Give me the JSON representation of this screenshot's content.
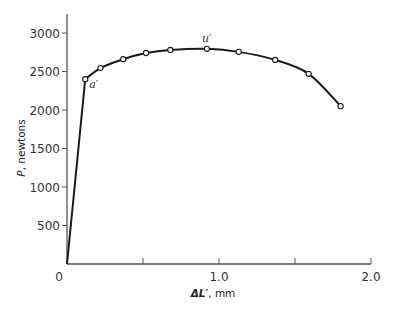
{
  "chart_data": {
    "type": "line",
    "title": "",
    "xlabel": "ΔL′, mm",
    "ylabel": "P, newtons",
    "xlim": [
      0,
      2.0
    ],
    "ylim": [
      0,
      3250
    ],
    "x_ticks": [
      0,
      0.5,
      1.0,
      1.5,
      2.0
    ],
    "x_tick_labels": [
      "0",
      "",
      "1.0",
      "",
      "2.0"
    ],
    "y_ticks": [
      500,
      1000,
      1500,
      2000,
      2500,
      3000
    ],
    "y_tick_labels": [
      "500",
      "1000",
      "1500",
      "2000",
      "2500",
      "3000"
    ],
    "grid": false,
    "legend": null,
    "series": [
      {
        "name": "load-elongation",
        "x": [
          0,
          0.12,
          0.22,
          0.37,
          0.52,
          0.68,
          0.92,
          1.13,
          1.37,
          1.59,
          1.8
        ],
        "y": [
          0,
          2400,
          2545,
          2660,
          2740,
          2780,
          2795,
          2755,
          2650,
          2470,
          2050
        ],
        "markers": [
          false,
          true,
          true,
          true,
          true,
          true,
          true,
          true,
          true,
          true,
          true
        ]
      }
    ],
    "annotations": [
      {
        "text": "a′",
        "x": 0.12,
        "y": 2400,
        "position": "right-below"
      },
      {
        "text": "u′",
        "x": 0.92,
        "y": 2795,
        "position": "above"
      }
    ]
  }
}
